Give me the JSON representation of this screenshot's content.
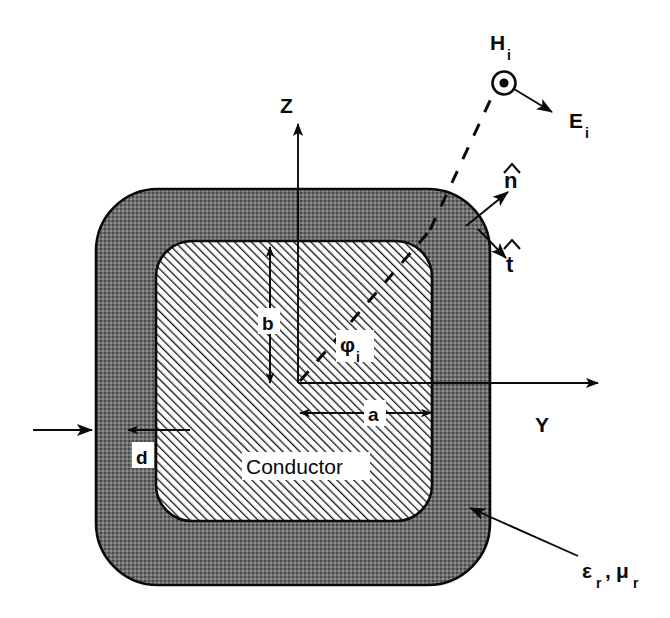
{
  "figure": {
    "background_color": "#ffffff",
    "ink_color": "#0a0a0a",
    "coating_fill_color": "#707070",
    "conductor_fill_color": "#ffffff"
  },
  "axes": {
    "vertical": {
      "label": "Z",
      "direction": "up"
    },
    "horizontal": {
      "label": "Y",
      "direction": "right"
    }
  },
  "incident_field": {
    "magnetic_label": "H",
    "magnetic_subscript": "i",
    "magnetic_marker": "circled-dot-out-of-page-icon",
    "electric_label": "E",
    "electric_subscript": "i",
    "incidence_angle_label": "φ",
    "incidence_angle_subscript": "i",
    "ray_style": "dashed"
  },
  "surface_vectors": [
    {
      "name": "normal",
      "label": "n",
      "accent": "hat",
      "direction": "outward-normal"
    },
    {
      "name": "tangent",
      "label": "t",
      "accent": "hat",
      "direction": "tangential"
    }
  ],
  "dimensions": [
    {
      "name": "half-width",
      "label": "a",
      "orientation": "horizontal"
    },
    {
      "name": "half-height",
      "label": "b",
      "orientation": "vertical"
    },
    {
      "name": "coating-thickness",
      "label": "d",
      "orientation": "horizontal"
    }
  ],
  "regions": [
    {
      "name": "conductor",
      "label": "Conductor",
      "fill": "diagonal-hatch"
    },
    {
      "name": "coating",
      "label": "",
      "fill": "gray-stipple"
    }
  ],
  "material_callout": {
    "permittivity": "ε",
    "permittivity_subscript": "r",
    "separator": ",",
    "permeability": "μ",
    "permeability_subscript": "r"
  },
  "incident_wave_arrow": {
    "name": "incident-wave-direction",
    "direction": "right"
  }
}
